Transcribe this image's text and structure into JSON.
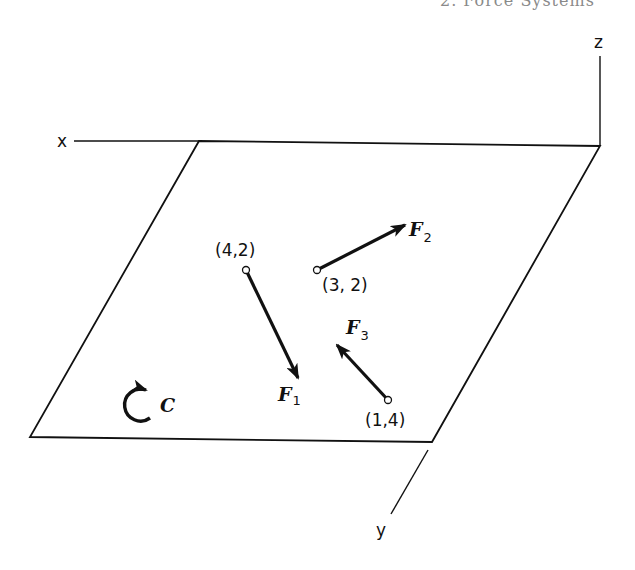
{
  "header": {
    "partial_text": "2. Force Systems"
  },
  "axes": {
    "x": {
      "label": "x"
    },
    "y": {
      "label": "y"
    },
    "z": {
      "label": "z"
    }
  },
  "plane": {
    "shape": "parallelogram",
    "stroke": "#111111"
  },
  "forces": [
    {
      "name": "F",
      "subscript": "1",
      "application_point": "(4,2)",
      "direction": "down-right"
    },
    {
      "name": "F",
      "subscript": "2",
      "application_point": "(3, 2)",
      "direction": "up-right"
    },
    {
      "name": "F",
      "subscript": "3",
      "application_point": "(1,4)",
      "direction": "up-left"
    }
  ],
  "couple": {
    "label": "C",
    "direction": "clockwise-open-arc"
  },
  "colors": {
    "ink": "#111111",
    "background": "#ffffff"
  }
}
